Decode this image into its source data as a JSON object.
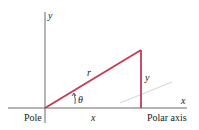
{
  "diagram": {
    "type": "polar-cartesian-relation",
    "colors": {
      "axis": "#6b6b6b",
      "triangle": "#c43a52",
      "dashed": "#c8c8c8",
      "text": "#222222"
    },
    "labels": {
      "y_axis": "y",
      "x_axis": "x",
      "radius": "r",
      "angle": "θ",
      "side_y": "y",
      "side_x": "x",
      "pole": "Pole",
      "polar_axis": "Polar axis"
    }
  }
}
